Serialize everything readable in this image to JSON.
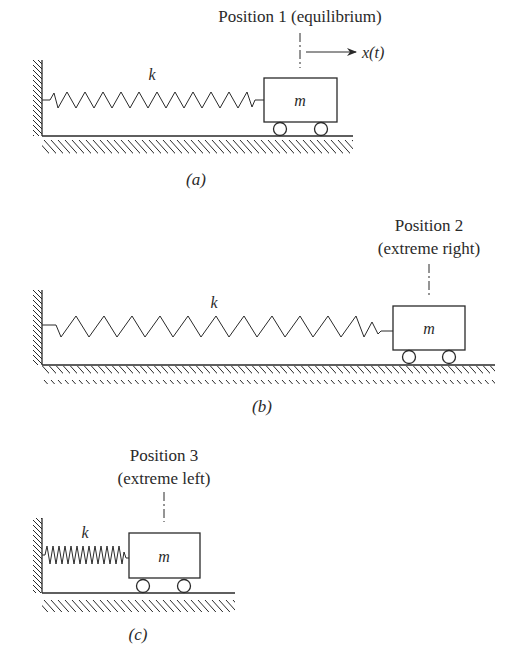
{
  "figure": {
    "panels": [
      {
        "id": "a",
        "caption": "(a)",
        "position_label": "Position 1 (equilibrium)",
        "position_label_line2": "",
        "spring_label": "k",
        "mass_label": "m",
        "displacement_label": "x(t)",
        "spring_state": "equilibrium"
      },
      {
        "id": "b",
        "caption": "(b)",
        "position_label": "Position 2",
        "position_label_line2": "(extreme right)",
        "spring_label": "k",
        "mass_label": "m",
        "spring_state": "stretched"
      },
      {
        "id": "c",
        "caption": "(c)",
        "position_label": "Position 3",
        "position_label_line2": "(extreme left)",
        "spring_label": "k",
        "mass_label": "m",
        "spring_state": "compressed"
      }
    ],
    "colors": {
      "ink": "#2a2a2a",
      "background": "#ffffff"
    }
  }
}
